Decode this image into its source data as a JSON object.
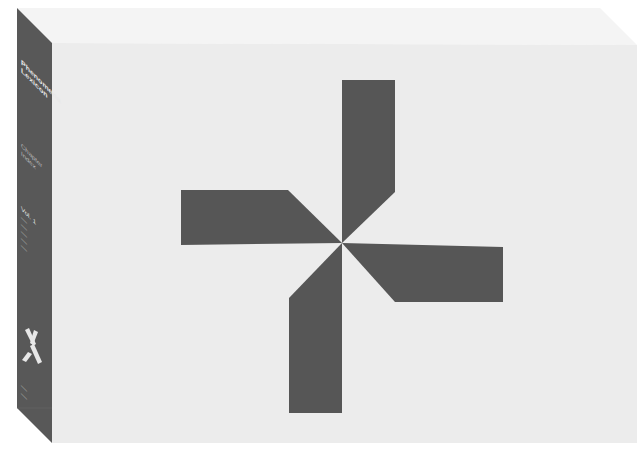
{
  "object": {
    "type": "box",
    "description": "Boxed set with a pinwheel emblem on the front face",
    "colors": {
      "background": "#ffffff",
      "top_face": "#f4f4f4",
      "front_face": "#ececec",
      "spine": "#585858",
      "emblem": "#565656",
      "spine_text": "#e8e8e8"
    }
  },
  "spine": {
    "title_line1": "Phenomena",
    "title_line2": "Lexicon",
    "subtitle_line1": "Chapter",
    "subtitle_line2": "Index",
    "volume": "Vol. 1",
    "list_lines": [
      "—",
      "—",
      "—",
      "—",
      "—"
    ],
    "footer_line1": "—",
    "footer_line2": "—"
  },
  "front": {
    "emblem": "pinwheel-icon"
  }
}
